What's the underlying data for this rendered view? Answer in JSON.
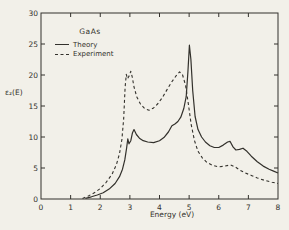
{
  "figure": {
    "background": "#f2f0e9",
    "ink": "#33312c"
  },
  "chart_data": {
    "type": "line",
    "title": "GaAs",
    "xlabel": "Energy (eV)",
    "ylabel": "ε₂(E)",
    "xlim": [
      0,
      8
    ],
    "ylim": [
      0,
      30
    ],
    "xticks_labeled": [
      0,
      1,
      2,
      3,
      4,
      5,
      6,
      7,
      8
    ],
    "yticks_labeled": [
      0,
      5,
      10,
      15,
      20,
      25,
      30
    ],
    "grid": false,
    "frame": "full-box-with-mirrored-ticks",
    "legend_position": "upper-left-inside",
    "series": [
      {
        "name": "Theory",
        "style": "solid",
        "points": [
          [
            1.5,
            0.1
          ],
          [
            1.7,
            0.35
          ],
          [
            1.9,
            0.65
          ],
          [
            2.1,
            1.0
          ],
          [
            2.3,
            1.6
          ],
          [
            2.5,
            2.5
          ],
          [
            2.65,
            3.6
          ],
          [
            2.75,
            4.8
          ],
          [
            2.83,
            6.3
          ],
          [
            2.89,
            8.2
          ],
          [
            2.93,
            9.7
          ],
          [
            2.97,
            8.9
          ],
          [
            3.03,
            9.4
          ],
          [
            3.09,
            10.7
          ],
          [
            3.14,
            11.2
          ],
          [
            3.22,
            10.4
          ],
          [
            3.32,
            9.8
          ],
          [
            3.45,
            9.4
          ],
          [
            3.6,
            9.2
          ],
          [
            3.8,
            9.1
          ],
          [
            4.0,
            9.4
          ],
          [
            4.15,
            9.9
          ],
          [
            4.3,
            10.8
          ],
          [
            4.42,
            11.8
          ],
          [
            4.52,
            12.1
          ],
          [
            4.62,
            12.5
          ],
          [
            4.72,
            13.2
          ],
          [
            4.82,
            14.6
          ],
          [
            4.9,
            16.5
          ],
          [
            4.96,
            20.5
          ],
          [
            5.01,
            24.8
          ],
          [
            5.06,
            22.5
          ],
          [
            5.12,
            17.5
          ],
          [
            5.2,
            13.3
          ],
          [
            5.3,
            11.2
          ],
          [
            5.42,
            10.0
          ],
          [
            5.55,
            9.2
          ],
          [
            5.7,
            8.6
          ],
          [
            5.85,
            8.3
          ],
          [
            6.0,
            8.3
          ],
          [
            6.15,
            8.7
          ],
          [
            6.3,
            9.2
          ],
          [
            6.38,
            9.3
          ],
          [
            6.48,
            8.4
          ],
          [
            6.58,
            7.9
          ],
          [
            6.7,
            8.0
          ],
          [
            6.82,
            8.2
          ],
          [
            6.95,
            7.7
          ],
          [
            7.1,
            6.9
          ],
          [
            7.3,
            6.0
          ],
          [
            7.5,
            5.3
          ],
          [
            7.7,
            4.8
          ],
          [
            7.85,
            4.5
          ],
          [
            8.0,
            4.2
          ]
        ]
      },
      {
        "name": "Experiment",
        "style": "dashed",
        "points": [
          [
            1.4,
            0.1
          ],
          [
            1.6,
            0.5
          ],
          [
            1.8,
            1.0
          ],
          [
            2.0,
            1.7
          ],
          [
            2.2,
            2.7
          ],
          [
            2.4,
            4.0
          ],
          [
            2.55,
            5.6
          ],
          [
            2.65,
            7.3
          ],
          [
            2.73,
            9.6
          ],
          [
            2.79,
            13.0
          ],
          [
            2.84,
            18.0
          ],
          [
            2.88,
            20.1
          ],
          [
            2.92,
            19.4
          ],
          [
            2.98,
            19.9
          ],
          [
            3.03,
            20.6
          ],
          [
            3.08,
            19.7
          ],
          [
            3.14,
            18.1
          ],
          [
            3.23,
            16.5
          ],
          [
            3.36,
            15.3
          ],
          [
            3.5,
            14.6
          ],
          [
            3.65,
            14.3
          ],
          [
            3.8,
            14.7
          ],
          [
            3.95,
            15.4
          ],
          [
            4.1,
            16.4
          ],
          [
            4.25,
            17.6
          ],
          [
            4.4,
            18.8
          ],
          [
            4.55,
            19.8
          ],
          [
            4.68,
            20.5
          ],
          [
            4.78,
            20.0
          ],
          [
            4.88,
            18.3
          ],
          [
            4.97,
            15.5
          ],
          [
            5.07,
            12.0
          ],
          [
            5.18,
            9.4
          ],
          [
            5.3,
            7.7
          ],
          [
            5.45,
            6.6
          ],
          [
            5.6,
            5.9
          ],
          [
            5.8,
            5.4
          ],
          [
            6.0,
            5.2
          ],
          [
            6.2,
            5.3
          ],
          [
            6.4,
            5.5
          ],
          [
            6.55,
            5.2
          ],
          [
            6.7,
            4.7
          ],
          [
            6.9,
            4.2
          ],
          [
            7.1,
            3.8
          ],
          [
            7.3,
            3.4
          ],
          [
            7.55,
            3.0
          ],
          [
            7.8,
            2.7
          ],
          [
            8.0,
            2.5
          ]
        ]
      }
    ]
  }
}
